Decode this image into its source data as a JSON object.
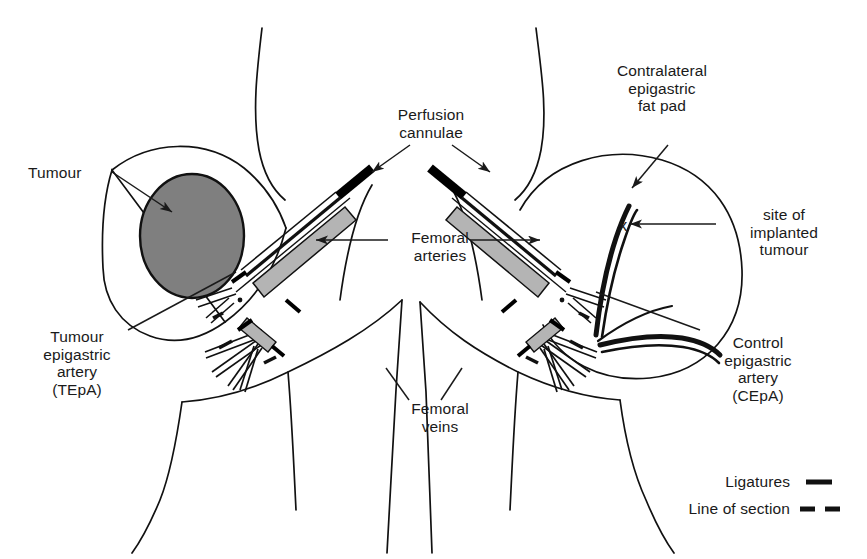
{
  "labels": {
    "tumour": "Tumour",
    "tumour_epigastric_artery": "Tumour\nepigastric\nartery\n(TEpA)",
    "perfusion_cannulae": "Perfusion\ncannulae",
    "femoral_arteries": "Femoral\narteries",
    "femoral_veins": "Femoral\nveins",
    "contralateral_fat_pad": "Contralateral\nepigastric\nfat pad",
    "site_of_implanted_tumour": "site of\nimplanted\ntumour",
    "control_epigastric_artery": "Control\nepigastric\nartery\n(CEpA)",
    "tumour_site_marker": "x"
  },
  "legend": {
    "items": [
      {
        "label": "Ligatures",
        "style": "solid-thick-dash"
      },
      {
        "label": "Line of section",
        "style": "double-dash"
      }
    ]
  },
  "colors": {
    "ink": "#1a1a1a",
    "outline": "#111111",
    "tumour_fill": "#7f7f7f",
    "vessel_fill": "#b4b4b4",
    "cannula": "#000000",
    "background": "#ffffff"
  },
  "structures": [
    {
      "name": "left-epigastric-fat-pad",
      "side": "left",
      "contains": "Tumour"
    },
    {
      "name": "right-epigastric-fat-pad",
      "side": "right",
      "contains": "site of implanted tumour"
    },
    {
      "name": "left-femoral-artery",
      "side": "left"
    },
    {
      "name": "right-femoral-artery",
      "side": "right"
    },
    {
      "name": "left-perfusion-cannula",
      "side": "left"
    },
    {
      "name": "right-perfusion-cannula",
      "side": "right"
    },
    {
      "name": "femoral-vein-bundle",
      "side": "both"
    }
  ]
}
